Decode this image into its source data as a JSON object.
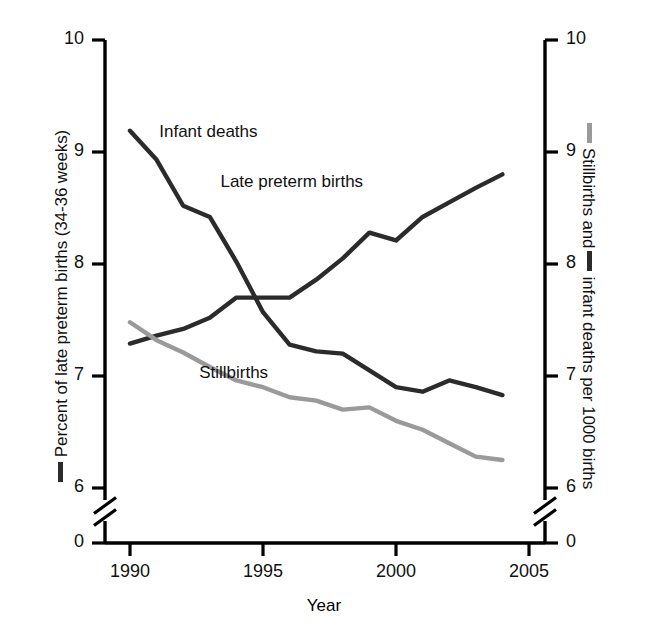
{
  "chart_data": {
    "type": "line",
    "title": "",
    "xlabel": "Year",
    "ylabel_left": "Percent of late preterm births (34-36 weeks)",
    "ylabel_right": "Stillbirths and  infant deaths per 1000 births",
    "ylabel_left_parts": {
      "prefix_marker": "dark-line",
      "text": "Percent of late preterm births (34-36 weeks)"
    },
    "ylabel_right_parts": {
      "marker1": "gray-line",
      "text1": "Stillbirths and",
      "marker2": "dark-line",
      "text2": "infant deaths per 1000 births"
    },
    "x": [
      1990,
      1991,
      1992,
      1993,
      1994,
      1995,
      1996,
      1997,
      1998,
      1999,
      2000,
      2001,
      2002,
      2003,
      2004
    ],
    "xticks": [
      "1990",
      "1995",
      "2000",
      "2005"
    ],
    "xtick_values": [
      1990,
      1995,
      2000,
      2005
    ],
    "xlim": [
      1989,
      2005.6
    ],
    "yticks": [
      "0",
      "6",
      "7",
      "8",
      "9",
      "10"
    ],
    "ytick_values": [
      0,
      6,
      7,
      8,
      9,
      10
    ],
    "ylim": [
      6.0,
      10.0
    ],
    "axis_break": true,
    "axis_break_note": "Scale break between 0 and 6 on both vertical axes",
    "grid": false,
    "legend_position": "inline-labels",
    "series": [
      {
        "name": "Late preterm births",
        "color": "#2b2b2b",
        "axis": "left",
        "label_x": 1993.4,
        "label_y": 8.72,
        "values": [
          7.29,
          7.36,
          7.42,
          7.52,
          7.7,
          7.7,
          7.7,
          7.86,
          8.05,
          8.28,
          8.21,
          8.42,
          8.55,
          8.68,
          8.8
        ]
      },
      {
        "name": "Infant deaths",
        "color": "#2b2b2b",
        "axis": "right",
        "label_x": 1991.1,
        "label_y": 9.17,
        "values": [
          9.19,
          8.93,
          8.52,
          8.42,
          8.02,
          7.57,
          7.28,
          7.22,
          7.2,
          7.05,
          6.9,
          6.86,
          6.96,
          6.9,
          6.83
        ]
      },
      {
        "name": "Stillbirths",
        "color": "#9a9a9a",
        "axis": "right",
        "label_x": 1992.6,
        "label_y": 7.02,
        "values": [
          7.48,
          7.32,
          7.21,
          7.08,
          6.96,
          6.9,
          6.81,
          6.78,
          6.7,
          6.72,
          6.6,
          6.52,
          6.4,
          6.28,
          6.25
        ]
      }
    ]
  }
}
